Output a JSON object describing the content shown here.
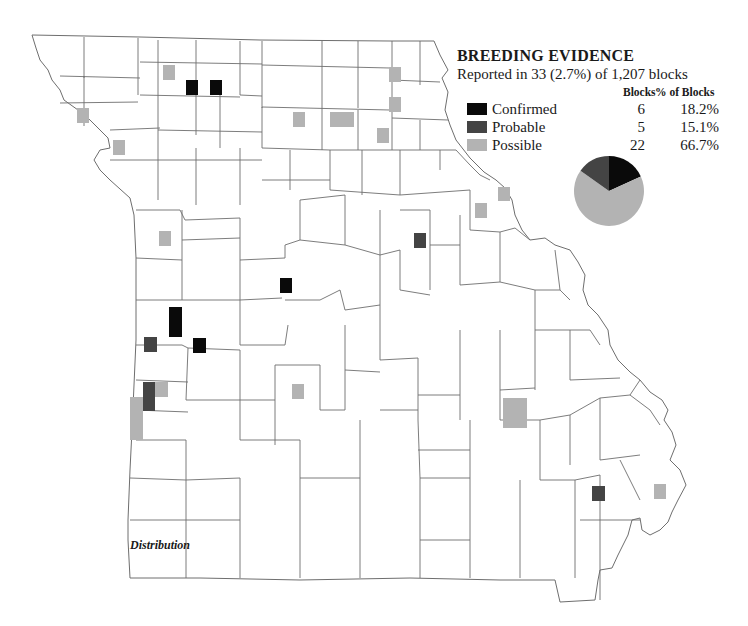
{
  "legend": {
    "title": "BREEDING EVIDENCE",
    "subtitle": "Reported in 33 (2.7%) of 1,207 blocks",
    "col_blocks": "Blocks",
    "col_pct": "% of Blocks",
    "rows": [
      {
        "label": "Confirmed",
        "blocks": "6",
        "pct": "18.2%",
        "color": "#0a0a0a"
      },
      {
        "label": "Probable",
        "blocks": "5",
        "pct": "15.1%",
        "color": "#444444"
      },
      {
        "label": "Possible",
        "blocks": "22",
        "pct": "66.7%",
        "color": "#b3b3b3"
      }
    ]
  },
  "caption": "Distribution",
  "chart_data": {
    "type": "pie",
    "title": "BREEDING EVIDENCE",
    "subtitle": "Reported in 33 (2.7%) of 1,207 blocks",
    "categories": [
      "Confirmed",
      "Probable",
      "Possible"
    ],
    "values": [
      6,
      5,
      22
    ],
    "percent": [
      18.2,
      15.1,
      66.7
    ],
    "colors": [
      "#0a0a0a",
      "#444444",
      "#b3b3b3"
    ],
    "total_blocks_reported": 33,
    "total_blocks": 1207
  },
  "map": {
    "blocks": [
      {
        "cat": "confirmed",
        "x": 186,
        "y": 80,
        "w": 12,
        "h": 15
      },
      {
        "cat": "confirmed",
        "x": 210,
        "y": 80,
        "w": 12,
        "h": 15
      },
      {
        "cat": "confirmed",
        "x": 280,
        "y": 278,
        "w": 12,
        "h": 15
      },
      {
        "cat": "confirmed",
        "x": 169,
        "y": 307,
        "w": 13,
        "h": 30
      },
      {
        "cat": "confirmed",
        "x": 193,
        "y": 338,
        "w": 13,
        "h": 15
      },
      {
        "cat": "probable",
        "x": 144,
        "y": 337,
        "w": 13,
        "h": 15
      },
      {
        "cat": "probable",
        "x": 143,
        "y": 382,
        "w": 12,
        "h": 29
      },
      {
        "cat": "probable",
        "x": 414,
        "y": 233,
        "w": 12,
        "h": 15
      },
      {
        "cat": "probable",
        "x": 592,
        "y": 486,
        "w": 13,
        "h": 15
      },
      {
        "cat": "possible",
        "x": 163,
        "y": 65,
        "w": 12,
        "h": 15
      },
      {
        "cat": "possible",
        "x": 77,
        "y": 108,
        "w": 12,
        "h": 15
      },
      {
        "cat": "possible",
        "x": 113,
        "y": 140,
        "w": 12,
        "h": 15
      },
      {
        "cat": "possible",
        "x": 159,
        "y": 231,
        "w": 12,
        "h": 15
      },
      {
        "cat": "possible",
        "x": 293,
        "y": 112,
        "w": 12,
        "h": 15
      },
      {
        "cat": "possible",
        "x": 330,
        "y": 112,
        "w": 24,
        "h": 15
      },
      {
        "cat": "possible",
        "x": 389,
        "y": 67,
        "w": 12,
        "h": 15
      },
      {
        "cat": "possible",
        "x": 389,
        "y": 97,
        "w": 12,
        "h": 15
      },
      {
        "cat": "possible",
        "x": 377,
        "y": 128,
        "w": 12,
        "h": 15
      },
      {
        "cat": "possible",
        "x": 498,
        "y": 187,
        "w": 12,
        "h": 14
      },
      {
        "cat": "possible",
        "x": 475,
        "y": 203,
        "w": 12,
        "h": 15
      },
      {
        "cat": "possible",
        "x": 155,
        "y": 382,
        "w": 13,
        "h": 15
      },
      {
        "cat": "possible",
        "x": 130,
        "y": 397,
        "w": 13,
        "h": 43
      },
      {
        "cat": "possible",
        "x": 292,
        "y": 384,
        "w": 12,
        "h": 15
      },
      {
        "cat": "possible",
        "x": 503,
        "y": 398,
        "w": 24,
        "h": 30
      },
      {
        "cat": "possible",
        "x": 654,
        "y": 484,
        "w": 12,
        "h": 15
      }
    ]
  }
}
